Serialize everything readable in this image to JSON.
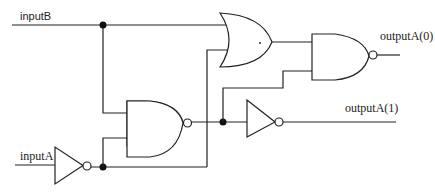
{
  "diagram": {
    "type": "logic-circuit",
    "inputs": [
      {
        "id": "inputB",
        "label": "inputB"
      },
      {
        "id": "inputA",
        "label": "inputA"
      }
    ],
    "outputs": [
      {
        "id": "outputA0",
        "label": "outputA(0)"
      },
      {
        "id": "outputA1",
        "label": "outputA(1)"
      }
    ],
    "gates": [
      {
        "id": "not1",
        "type": "NOT",
        "inputs": [
          "inputA"
        ]
      },
      {
        "id": "nand1",
        "type": "NAND",
        "inputs": [
          "inputB",
          "not1"
        ]
      },
      {
        "id": "or1",
        "type": "OR",
        "inputs": [
          "inputB",
          "not1"
        ]
      },
      {
        "id": "not2",
        "type": "NOT",
        "inputs": [
          "nand1"
        ],
        "output": "outputA(1)"
      },
      {
        "id": "nand2",
        "type": "NAND",
        "inputs": [
          "or1",
          "nand1"
        ],
        "output": "outputA(0)"
      }
    ],
    "junctions": 3
  },
  "labels": {
    "inputB": "inputB",
    "inputA": "inputA",
    "outputA0": "outputA(0)",
    "outputA1": "outputA(1)"
  }
}
